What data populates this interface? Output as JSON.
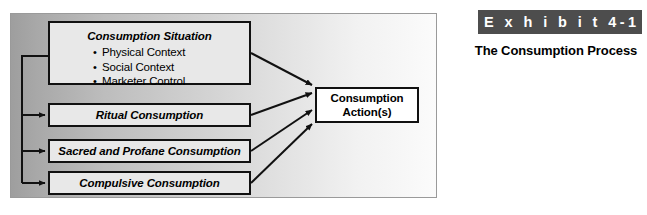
{
  "figure": {
    "name": "exhibit-figure",
    "diagram": {
      "nodes": {
        "situation": {
          "title": "Consumption Situation",
          "bullets": [
            "Physical Context",
            "Social Context",
            "Marketer Control"
          ]
        },
        "ritual": {
          "title": "Ritual Consumption"
        },
        "sacred": {
          "title": "Sacred and Profane Consumption"
        },
        "compulsive": {
          "title": "Compulsive Consumption"
        },
        "action": {
          "line1": "Consumption",
          "line2": "Action(s)"
        }
      },
      "colors": {
        "panel_gradient_start": "#9e9e9e",
        "panel_gradient_end": "#fbfbfb",
        "node_fill": "#e8e8e8",
        "action_node_fill": "#ffffff",
        "stroke": "#111111"
      }
    },
    "caption": {
      "exhibit_label": "E x h i b i t  4-1",
      "title": "The Consumption Process",
      "bar_color": "#4d4d4d",
      "bar_text_color": "#ffffff"
    }
  }
}
